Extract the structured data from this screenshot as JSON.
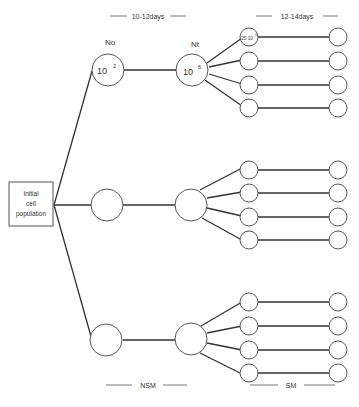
{
  "header": {
    "phase1_duration": "10-12days",
    "phase2_duration": "12-14days",
    "col_no_label": "No",
    "col_nt_label": "Nt"
  },
  "root": {
    "line1": "Initial",
    "line2": "cell",
    "line3": "population"
  },
  "nodes": {
    "no_value": "10",
    "no_exp": "2",
    "nt_value": "10",
    "nt_exp": "6",
    "sub_value": "25·10",
    "sub_exp": "4"
  },
  "footer": {
    "phase1_medium": "NSM",
    "phase2_medium": "SM"
  },
  "colors": {
    "stroke": "#555555",
    "line": "#333333",
    "text": "#333333"
  }
}
